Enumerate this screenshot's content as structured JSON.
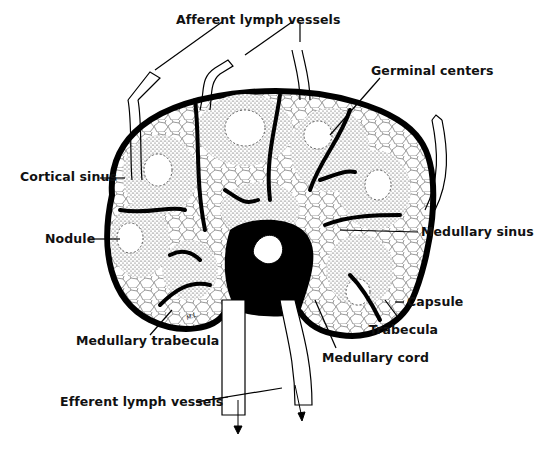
{
  "figure": {
    "labels": {
      "afferent": "Afferent lymph vessels",
      "germinal": "Germinal centers",
      "cortical_sinus": "Cortical sinus",
      "nodule": "Nodule",
      "medullary_sinus": "Medullary sinus",
      "capsule": "Capsule",
      "trabecula": "Trabecula",
      "medullary_trabecula": "Medullary trabecula",
      "medullary_cord": "Medullary cord",
      "efferent": "Efferent lymph vessels"
    },
    "signature": "M.L."
  }
}
